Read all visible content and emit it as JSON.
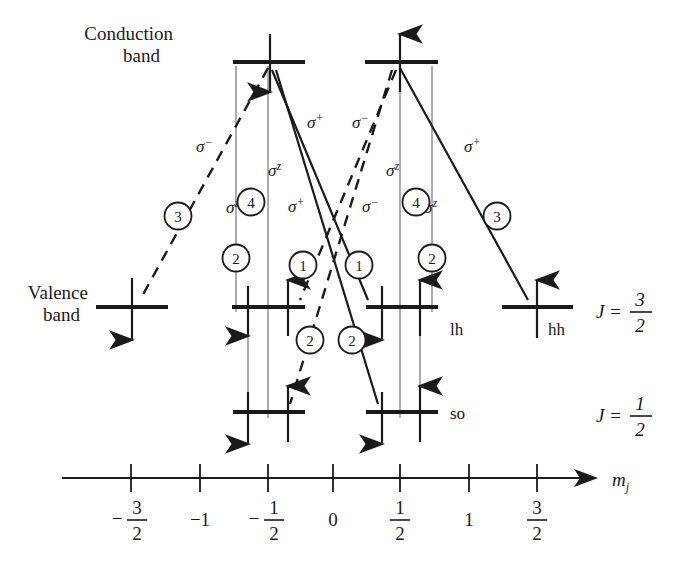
{
  "figure": {
    "type": "energy-level-diagram",
    "title": ""
  },
  "labels": {
    "conduction_band_line1": "Conduction",
    "conduction_band_line2": "band",
    "valence_band_line1": "Valence",
    "valence_band_line2": "band",
    "lh": "lh",
    "hh": "hh",
    "so": "so",
    "axis_name": "m",
    "axis_sub": "j",
    "j_three_half": {
      "sym": "J",
      "eq": "=",
      "num": "3",
      "den": "2"
    },
    "j_one_half": {
      "sym": "J",
      "eq": "=",
      "num": "1",
      "den": "2"
    }
  },
  "axis": {
    "ticks": [
      {
        "value": -1.5,
        "x": 131,
        "label_type": "fraction",
        "sign": "−",
        "num": "3",
        "den": "2"
      },
      {
        "value": -1.0,
        "x": 200,
        "label_type": "integer",
        "text": "−1"
      },
      {
        "value": -0.5,
        "x": 268,
        "label_type": "fraction",
        "sign": "−",
        "num": "1",
        "den": "2"
      },
      {
        "value": 0.0,
        "x": 333,
        "label_type": "integer",
        "text": "0"
      },
      {
        "value": 0.5,
        "x": 400,
        "label_type": "fraction",
        "sign": "",
        "num": "1",
        "den": "2"
      },
      {
        "value": 1.0,
        "x": 469,
        "label_type": "integer",
        "text": "1"
      },
      {
        "value": 1.5,
        "x": 537,
        "label_type": "fraction",
        "sign": "",
        "num": "3",
        "den": "2"
      }
    ],
    "y": 478,
    "x_start": 62,
    "x_end": 600
  },
  "levels": [
    {
      "name": "cb-minus-half",
      "band": "conduction",
      "mj": -0.5,
      "x": 268,
      "y": 62,
      "spin": "down"
    },
    {
      "name": "cb-plus-half",
      "band": "conduction",
      "mj": 0.5,
      "x": 400,
      "y": 62,
      "spin": "up"
    },
    {
      "name": "vb-lh-minus-three-half",
      "band": "valence-hh",
      "mj": -1.5,
      "x": 132,
      "y": 307,
      "spin": "down"
    },
    {
      "name": "vb-lh-minus-half",
      "band": "valence-lh",
      "mj": -0.5,
      "x": 268,
      "y": 307,
      "spin": "both"
    },
    {
      "name": "vb-lh-plus-half",
      "band": "valence-lh",
      "mj": 0.5,
      "x": 400,
      "y": 307,
      "spin": "both"
    },
    {
      "name": "vb-hh-plus-three-half",
      "band": "valence-hh",
      "mj": 1.5,
      "x": 537,
      "y": 307,
      "spin": "up"
    },
    {
      "name": "vb-so-minus-half",
      "band": "split-off",
      "mj": -0.5,
      "x": 268,
      "y": 412,
      "spin": "both"
    },
    {
      "name": "vb-so-plus-half",
      "band": "split-off",
      "mj": 0.5,
      "x": 400,
      "y": 412,
      "spin": "both"
    }
  ],
  "transitions": [
    {
      "id": "t-sigma-minus-3-left",
      "polarization": "σ",
      "superscript": "−",
      "strength": "3",
      "style": "dashed",
      "label_x": 205,
      "label_y": 148,
      "circle_x": 178,
      "circle_y": 216
    },
    {
      "id": "t-sigma-z-2-left",
      "polarization": "σ",
      "superscript": "z",
      "strength": "2",
      "style": "solid-thin",
      "label_x": 236,
      "label_y": 207,
      "circle_x": 236,
      "circle_y": 258
    },
    {
      "id": "t-sigma-z-4-left",
      "polarization": "σ",
      "superscript": "z",
      "strength": "4",
      "style": "solid-thin",
      "label_x": 278,
      "label_y": 170,
      "circle_x": 268,
      "circle_y": 202
    },
    {
      "id": "t-sigma-plus-1-left",
      "polarization": "σ",
      "superscript": "+",
      "strength": "1",
      "style": "solid",
      "label_x": 318,
      "label_y": 126,
      "circle_x": 303,
      "circle_y": 265
    },
    {
      "id": "t-sigma-plus-2-left",
      "polarization": "σ",
      "superscript": "+",
      "strength": "2",
      "style": "solid",
      "label_x": 297,
      "label_y": 206,
      "circle_x": 312,
      "circle_y": 339
    },
    {
      "id": "t-sigma-minus-1-right",
      "polarization": "σ",
      "superscript": "−",
      "strength": "1",
      "style": "dashed",
      "label_x": 357,
      "label_y": 126,
      "circle_x": 360,
      "circle_y": 265
    },
    {
      "id": "t-sigma-minus-2-right",
      "polarization": "σ",
      "superscript": "−",
      "strength": "2",
      "style": "dashed",
      "label_x": 372,
      "label_y": 206,
      "circle_x": 350,
      "circle_y": 339
    },
    {
      "id": "t-sigma-z-4-right",
      "polarization": "σ",
      "superscript": "z",
      "strength": "4",
      "style": "solid-thin",
      "label_x": 396,
      "label_y": 170,
      "circle_x": 400,
      "circle_y": 202
    },
    {
      "id": "t-sigma-z-2-right",
      "polarization": "σ",
      "superscript": "z",
      "strength": "2",
      "style": "solid-thin",
      "label_x": 432,
      "label_y": 207,
      "circle_x": 432,
      "circle_y": 258
    },
    {
      "id": "t-sigma-plus-3-right",
      "polarization": "σ",
      "superscript": "+",
      "strength": "3",
      "style": "solid",
      "label_x": 470,
      "label_y": 148,
      "circle_x": 497,
      "circle_y": 216
    }
  ],
  "colors": {
    "ink": "#1a1a1a",
    "thin_line": "#8c8c8c",
    "background": "#ffffff"
  }
}
